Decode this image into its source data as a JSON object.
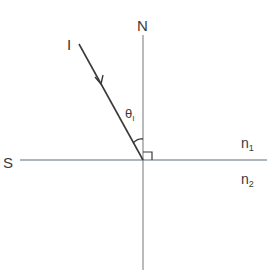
{
  "diagram": {
    "title": "",
    "labels": {
      "normal": "N",
      "incident": "I",
      "surface": "S",
      "angle_symbol": "θ",
      "angle_subscript": "I",
      "medium1": "n",
      "medium1_sub": "1",
      "medium2": "n",
      "medium2_sub": "2"
    },
    "colors": {
      "surface_line": "#5a6f80",
      "normal_line": "#777777",
      "ray": "#3a3a3a",
      "text": "#3a3a3a"
    }
  }
}
